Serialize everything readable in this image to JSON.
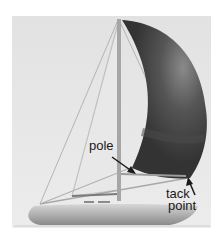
{
  "illustration": {
    "subject": "sailboat with spinnaker",
    "colors": {
      "background_outer": "#ffffff",
      "background_panel": "#e4e4e4",
      "sail_dark": "#3a3a3a",
      "sail_mid": "#5a5a5a",
      "sail_highlight": "#8a8a8a",
      "mast": "#a8a8a8",
      "rigging": "#b0b0b0",
      "hull_light": "#d8d8d8",
      "hull_dark": "#8c8c8c",
      "arrow": "#1a1a1a",
      "label_text": "#1a1a1a"
    }
  },
  "labels": {
    "pole": "pole",
    "tack_line1": "tack",
    "tack_line2": "point"
  }
}
